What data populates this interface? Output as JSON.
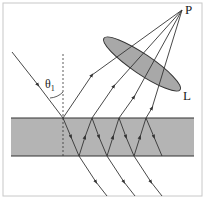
{
  "figure": {
    "type": "thin-film interference diagram",
    "labels": {
      "point": "P",
      "lens": "L",
      "angle": "θ",
      "angle_sub": "1"
    },
    "colors": {
      "film": "#b4b4b4",
      "lens": "#a8a8a8",
      "line": "#333333",
      "frame": "#c8c8c8"
    }
  }
}
